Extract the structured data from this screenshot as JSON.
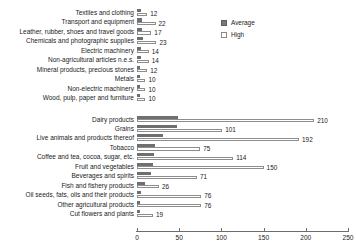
{
  "chart_data": {
    "type": "bar",
    "orientation": "horizontal",
    "title": "",
    "subtitle": "",
    "xlabel": "",
    "ylabel": "",
    "xlim": [
      0,
      250
    ],
    "xticks": [
      0,
      50,
      100,
      150,
      200,
      250
    ],
    "xtick_labels": [
      "0",
      "50",
      "100",
      "150",
      "200",
      "250"
    ],
    "grid": false,
    "legend_position": "top-right",
    "series": [
      {
        "name": "Average",
        "color": "#6f6f6f",
        "style": "filled",
        "values": [
          5,
          6,
          6,
          7,
          5,
          5,
          4,
          3,
          3,
          3,
          48,
          47,
          31,
          21,
          20,
          19,
          16,
          10,
          5,
          4,
          4
        ]
      },
      {
        "name": "High",
        "color": "#ffffff",
        "style": "outlined",
        "values": [
          12,
          22,
          17,
          23,
          14,
          14,
          12,
          10,
          10,
          10,
          210,
          101,
          192,
          75,
          114,
          150,
          71,
          26,
          76,
          76,
          19
        ]
      }
    ],
    "categories": [
      "Textiles and clothing",
      "Transport and equipment",
      "Leather, rubber, shoes and travel goods",
      "Chemicals and photographic supplies",
      "Electric machinery",
      "Non-agricultural articles n.e.s.",
      "Mineral products, precious stones",
      "Metals",
      "Non-electric machinery",
      "Wood, pulp, paper and furniture",
      "Dairy products",
      "Grains",
      "Live animals and products thereof",
      "Tobacco",
      "Coffee and tea, cocoa, sugar, etc.",
      "Fruit and vegetables",
      "Beverages and spirits",
      "Fish and fishery products",
      "Oil seeds, fats, oils and their products",
      "Other agricultural products",
      "Cut flowers and plants"
    ],
    "data_labels": {
      "series": "High",
      "values": [
        "12",
        "22",
        "17",
        "23",
        "14",
        "14",
        "12",
        "10",
        "10",
        "10",
        "210",
        "101",
        "192",
        "75",
        "114",
        "150",
        "71",
        "26",
        "76",
        "76",
        "19"
      ]
    },
    "groups": [
      {
        "name": "non-agricultural",
        "start_index": 0,
        "end_index": 9
      },
      {
        "name": "agricultural",
        "start_index": 10,
        "end_index": 20
      }
    ]
  },
  "legend": {
    "entries": [
      {
        "label": "Average",
        "swatch": "filled-gray-square"
      },
      {
        "label": "High",
        "swatch": "outlined-white-square"
      }
    ]
  },
  "colors": {
    "average": "#6f6f6f",
    "high_fill": "#ffffff",
    "high_border": "#8d8d8d",
    "axis": "#6d6d6d",
    "text": "#1a1a1a",
    "background": "#ffffff"
  }
}
